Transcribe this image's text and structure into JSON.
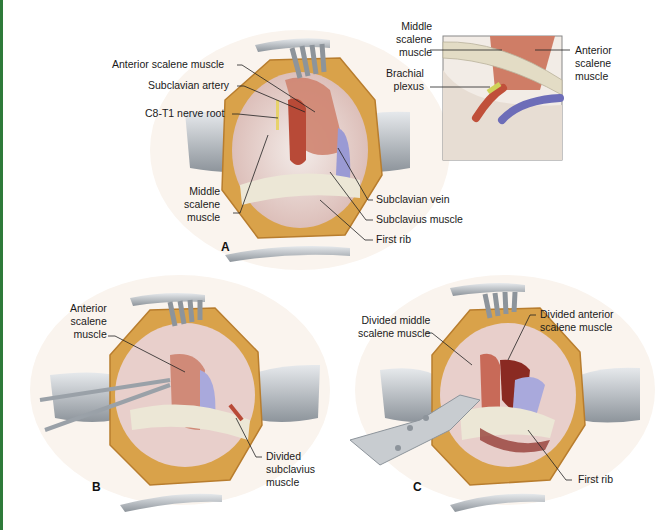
{
  "figure": {
    "panels": [
      {
        "letter": "A",
        "labels": [
          {
            "text": "Anterior scalene muscle"
          },
          {
            "text": "Subclavian artery"
          },
          {
            "text": "C8-T1 nerve root"
          },
          {
            "text": "Middle\nscalene\nmuscle"
          },
          {
            "text": "Subclavian vein"
          },
          {
            "text": "Subclavius muscle"
          },
          {
            "text": "First rib"
          }
        ]
      },
      {
        "letter": "B",
        "labels": [
          {
            "text": "Anterior\nscalene\nmuscle"
          },
          {
            "text": "Divided\nsubclavius\nmuscle"
          }
        ]
      },
      {
        "letter": "C",
        "labels": [
          {
            "text": "Divided middle\nscalene muscle"
          },
          {
            "text": "Divided anterior\nscalene muscle"
          },
          {
            "text": "First rib"
          }
        ]
      }
    ],
    "inset": {
      "labels": [
        {
          "text": "Middle\nscalene\nmuscle"
        },
        {
          "text": "Brachial\nplexus"
        },
        {
          "text": "Anterior\nscalene\nmuscle"
        }
      ]
    },
    "colors": {
      "accent_bar": "#2f7a3a",
      "fat": "#d9a24a",
      "muscle": "#c97a6a",
      "artery": "#c0503a",
      "vein": "#8a8ac8",
      "rib": "#ece7d6",
      "retractor": "#a7adb3"
    }
  }
}
